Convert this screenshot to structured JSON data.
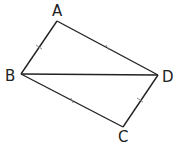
{
  "diagram": {
    "type": "quadrilateral-with-diagonal",
    "vertices": [
      {
        "name": "A",
        "x": 57,
        "y": 21,
        "label_x": 57,
        "label_y": 15
      },
      {
        "name": "B",
        "x": 21,
        "y": 74,
        "label_x": 12,
        "label_y": 80
      },
      {
        "name": "C",
        "x": 123,
        "y": 127,
        "label_x": 123,
        "label_y": 142
      },
      {
        "name": "D",
        "x": 158,
        "y": 75,
        "label_x": 168,
        "label_y": 81
      }
    ],
    "edges": [
      {
        "from": "A",
        "to": "B",
        "ticks": 1
      },
      {
        "from": "A",
        "to": "D",
        "ticks": 1
      },
      {
        "from": "B",
        "to": "C",
        "ticks": 1
      },
      {
        "from": "C",
        "to": "D",
        "ticks": 1
      },
      {
        "from": "B",
        "to": "D",
        "ticks": 0
      }
    ],
    "labels": {
      "A": "A",
      "B": "B",
      "C": "C",
      "D": "D"
    },
    "line_color": "#222222"
  }
}
